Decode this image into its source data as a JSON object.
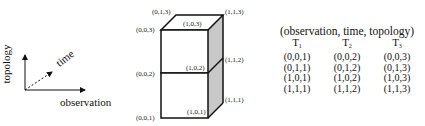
{
  "axes_legend": {
    "vertical_label": "topology",
    "diagonal_label": "time",
    "horizontal_label": "observation"
  },
  "cube": {
    "vertex_labels": {
      "v013": "(0,1,3)",
      "v113": "(1,1,3)",
      "v003": "(0,0,3)",
      "v103": "(1,0,3)",
      "v112": "(1,1,2)",
      "v002": "(0,0,2)",
      "v102": "(1,0,2)",
      "v111": "(1,1,1)",
      "v001": "(0,0,1)",
      "v101": "(1,0,1)"
    },
    "colors": {
      "edge": "#111111",
      "side_fill": "#c8c8c8",
      "front_fill": "#ffffff"
    }
  },
  "table": {
    "header": "(observation, time, topology)",
    "columns": [
      {
        "label": "T",
        "sub": "1"
      },
      {
        "label": "T",
        "sub": "2"
      },
      {
        "label": "T",
        "sub": "3"
      }
    ],
    "rows": [
      [
        "(0,0,1)",
        "(0,0,2)",
        "(0,0,3)"
      ],
      [
        "(0,1,1)",
        "(0,1,2)",
        "(0,1,3)"
      ],
      [
        "(1,0,1)",
        "(1,0,2)",
        "(1,0,3)"
      ],
      [
        "(1,1,1)",
        "(1,1,2)",
        "(1,1,3)"
      ]
    ]
  }
}
